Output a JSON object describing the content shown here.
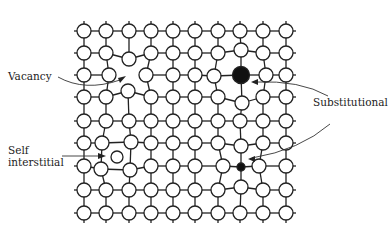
{
  "colors": {
    "line": "#222222",
    "atom_fill": "#ffffff",
    "solute_fill": "#111111",
    "background": "#ffffff"
  },
  "lattice": {
    "cols": [
      84,
      106,
      129,
      151,
      173,
      195,
      218,
      240,
      263,
      286
    ],
    "rows": [
      31,
      53,
      75,
      97,
      121,
      143,
      166,
      190,
      213
    ],
    "atom_radius": 7,
    "stub_length": 10
  },
  "defects": {
    "vacancy": {
      "label": "Vacancy",
      "position": [
        129,
        75
      ]
    },
    "substitutional_large": {
      "label": "Substitutional",
      "position": [
        241,
        75
      ],
      "radius": 8.5,
      "kind": "large"
    },
    "substitutional_small": {
      "label": "Substitutional",
      "position": [
        241,
        167
      ],
      "radius": 4,
      "kind": "small"
    },
    "self_interstitial": {
      "label_line1": "Self",
      "label_line2": "interstitial",
      "position": [
        117,
        157
      ],
      "radius": 6
    }
  },
  "labels": {
    "vacancy": "Vacancy",
    "substitutional": "Substitutional",
    "self_line1": "Self",
    "self_line2": "interstitial"
  }
}
